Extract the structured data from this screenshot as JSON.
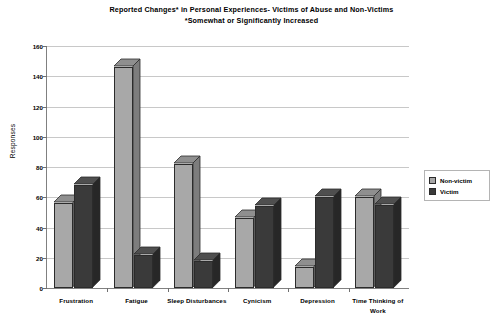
{
  "chart_data": {
    "type": "bar",
    "title": "Reported Changes* in Personal Experiences- Victims of Abuse and Non-Victims",
    "subtitle": "*Somewhat or Significantly Increased",
    "xlabel": "",
    "ylabel": "Responses",
    "ylim": [
      0,
      160
    ],
    "ytick_step": 20,
    "yticks": [
      160,
      140,
      120,
      100,
      80,
      60,
      40,
      20,
      0
    ],
    "grid": true,
    "legend_position": "right",
    "categories": [
      "Frustration",
      "Fatigue",
      "Sleep Disturbances",
      "Cynicism",
      "Depression",
      "Time Thinking of Work"
    ],
    "series": [
      {
        "name": "Non-victim",
        "color": "#a8a8a8",
        "values": [
          56,
          146,
          82,
          46,
          14,
          60
        ]
      },
      {
        "name": "Victim",
        "color": "#3a3a3a",
        "values": [
          68,
          22,
          18,
          54,
          60,
          55
        ]
      }
    ]
  },
  "legend": {
    "items": [
      {
        "label": "Non-victim"
      },
      {
        "label": "Victim"
      }
    ]
  }
}
